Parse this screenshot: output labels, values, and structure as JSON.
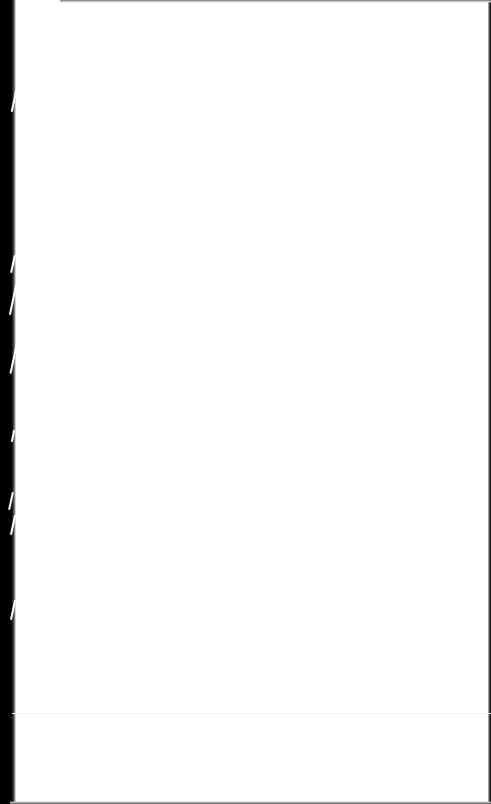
{
  "document": {
    "type": "scanned-blank-page",
    "text": "",
    "colors": {
      "paper": "#ffffff",
      "left_border": "#000000",
      "right_edge": "#1a1a1a"
    }
  }
}
